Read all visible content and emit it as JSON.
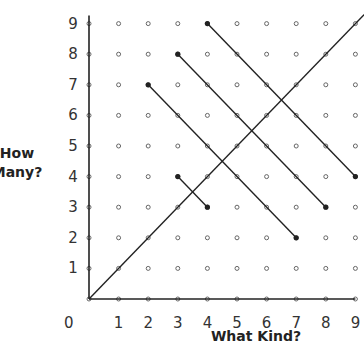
{
  "chart_data": {
    "type": "diagram",
    "title": "",
    "xlabel": "What Kind?",
    "ylabel_line1": "How",
    "ylabel_line2": "Many?",
    "origin_label": "0",
    "x_ticks": [
      "1",
      "2",
      "3",
      "4",
      "5",
      "6",
      "7",
      "8",
      "9"
    ],
    "y_ticks": [
      "1",
      "2",
      "3",
      "4",
      "5",
      "6",
      "7",
      "8",
      "9"
    ],
    "xlim": [
      0,
      9
    ],
    "ylim": [
      0,
      9
    ],
    "grid": "dot lattice 0-9",
    "segments": [
      {
        "from": [
          0,
          0
        ],
        "to": [
          9,
          9
        ],
        "extended": true
      },
      {
        "from": [
          4,
          9
        ],
        "to": [
          9,
          4
        ]
      },
      {
        "from": [
          3,
          8
        ],
        "to": [
          8,
          3
        ]
      },
      {
        "from": [
          2,
          7
        ],
        "to": [
          7,
          2
        ]
      },
      {
        "from": [
          3,
          4
        ],
        "to": [
          4,
          3
        ]
      }
    ],
    "endpoints": [
      [
        4,
        9
      ],
      [
        9,
        4
      ],
      [
        3,
        8
      ],
      [
        8,
        3
      ],
      [
        2,
        7
      ],
      [
        7,
        2
      ],
      [
        3,
        4
      ],
      [
        4,
        3
      ]
    ]
  },
  "colors": {
    "line": "#222222",
    "dot": "#666666",
    "text": "#333333"
  }
}
